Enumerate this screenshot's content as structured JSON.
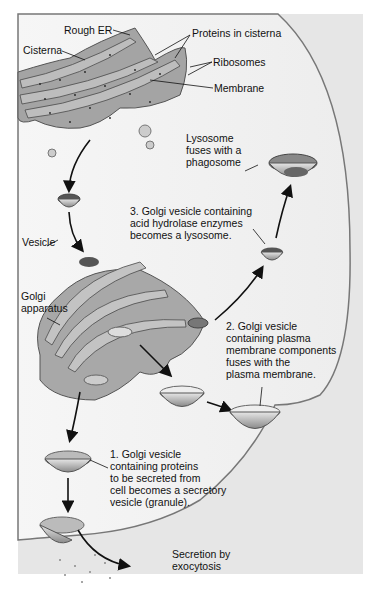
{
  "diagram": {
    "labels": {
      "rough_er": "Rough ER",
      "proteins_in_cisterna": "Proteins in cisterna",
      "cisterna": "Cisterna",
      "ribosomes": "Ribosomes",
      "membrane": "Membrane",
      "lysosome_fuses": [
        "Lysosome",
        "fuses with a",
        "phagosome"
      ],
      "step3": [
        "3. Golgi vesicle containing",
        "acid hydrolase enzymes",
        "becomes a lysosome."
      ],
      "vesicle": "Vesicle",
      "golgi": [
        "Golgi",
        "apparatus"
      ],
      "step2": [
        "2. Golgi vesicle",
        "containing plasma",
        "membrane components",
        "fuses with the",
        "plasma membrane."
      ],
      "step1": [
        "1. Golgi vesicle",
        "containing proteins",
        "to be secreted from",
        "cell becomes a secretory",
        "vesicle (granule)."
      ],
      "secretion": [
        "Secretion by",
        "exocytosis"
      ]
    },
    "colors": {
      "cytoplasm": "#f4f4f4",
      "membrane_outer": "#cfcfcf",
      "organelle": "#9a9a9a",
      "organelle_dark": "#6e6e6e",
      "ink": "#111111"
    }
  }
}
